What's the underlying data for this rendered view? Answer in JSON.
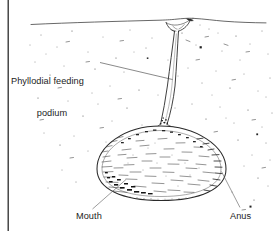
{
  "figure": {
    "background_color": "#ffffff",
    "ink_color": "#1c1c1c",
    "border": {
      "left_rule_color": "#2b2b2b",
      "left_rule_x": 8
    },
    "labels": {
      "podium_line1": "Phyllodial feeding",
      "podium_line2": "podium",
      "mouth": "Mouth",
      "anus": "Anus"
    },
    "anatomy": {
      "sediment_surface": "sediment-water interface line",
      "funnel": "surface feeding funnel",
      "stalk": "phyllodial feeding podium stalk",
      "body": "ovoid stippled body sac",
      "mouth_position": "lower left of body",
      "anus_position": "lower right of body"
    },
    "leaders": {
      "podium": "from label right edge to stalk midsection",
      "mouth": "from Mouth label up-right to body lower-left rim",
      "anus": "from Anus label up-left to body lower-right rim"
    }
  }
}
